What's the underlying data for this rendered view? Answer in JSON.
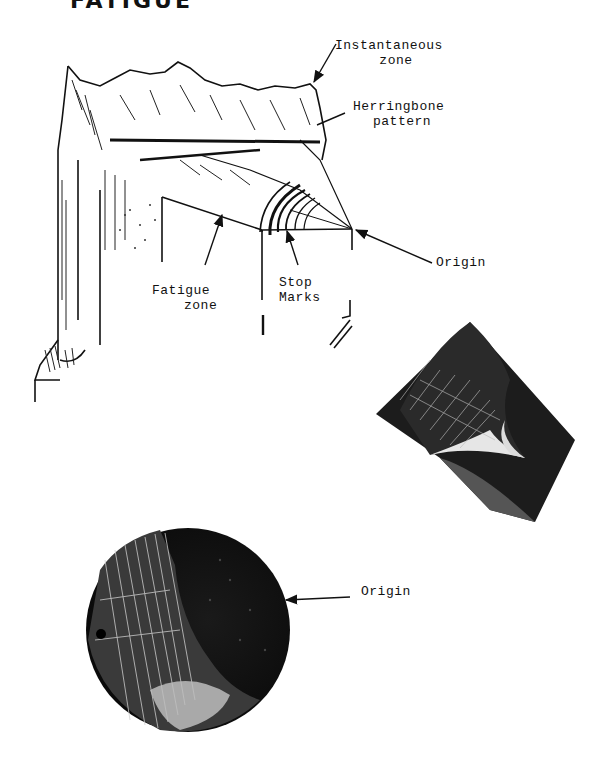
{
  "figure": {
    "title_fragment": "FATIGUE",
    "diagram": {
      "description": "Fatigue fracture surface sketch of square bar",
      "labels": {
        "instantaneous_zone": [
          "Instantaneous",
          "zone"
        ],
        "herringbone_pattern": [
          "Herringbone",
          "pattern"
        ],
        "origin": "Origin",
        "fatigue_zone": [
          "Fatigue",
          "zone"
        ],
        "stop_marks": [
          "Stop",
          "Marks"
        ]
      }
    },
    "photo_square": {
      "description": "Photograph of fatigue fracture on square section"
    },
    "photo_round": {
      "description": "Photograph of fatigue fracture on round section",
      "label": "Origin"
    }
  }
}
